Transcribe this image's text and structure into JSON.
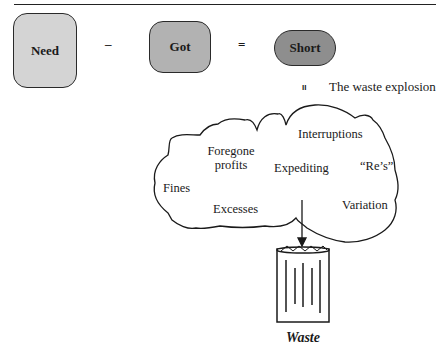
{
  "equation": {
    "term1": "Need",
    "operator1": "–",
    "term2": "Got",
    "operator2": "=",
    "result": "Short"
  },
  "caption": {
    "marker": "II",
    "text": "The waste explosion"
  },
  "cloud": {
    "items": [
      "Interruptions",
      "Foregone profits",
      "Expediting",
      "“Re’s”",
      "Fines",
      "Excesses",
      "Variation"
    ]
  },
  "bin": {
    "label": "Waste"
  },
  "colors": {
    "need_fill": "#d4d4d4",
    "got_fill": "#b2b2b2",
    "short_fill": "#8e8e8e",
    "outline": "#2a2a2a"
  }
}
